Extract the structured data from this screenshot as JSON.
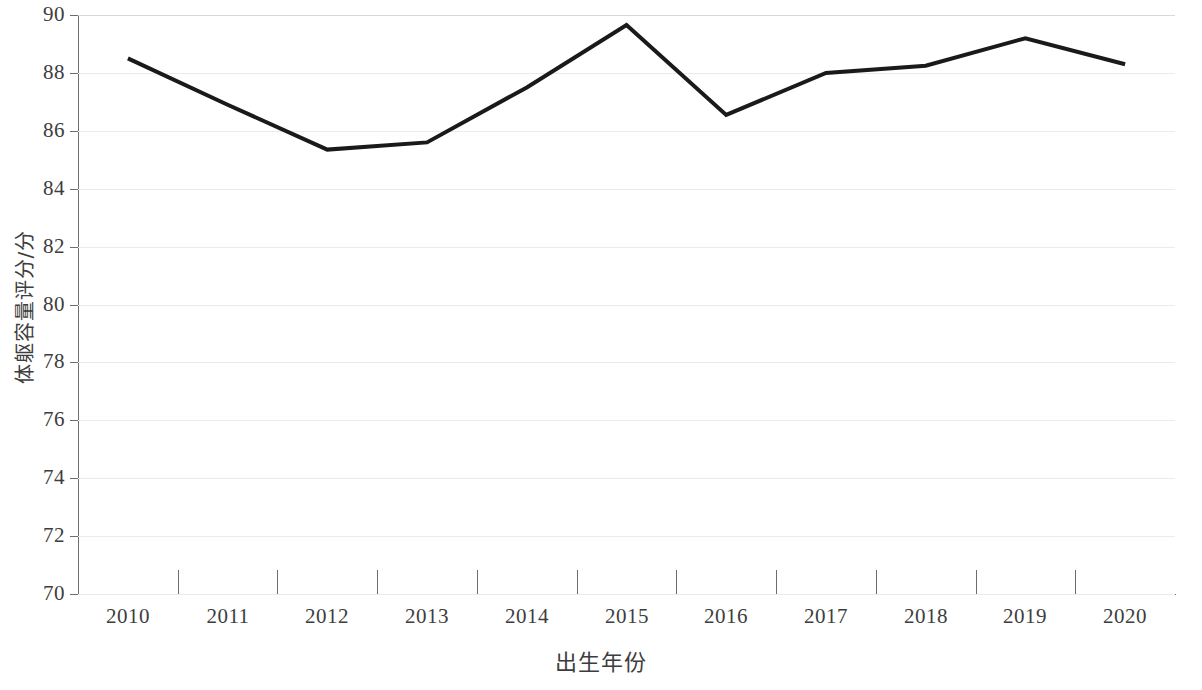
{
  "chart_data": {
    "type": "line",
    "title": "",
    "xlabel": "出生年份",
    "ylabel": "体躯容量评分/分",
    "categories": [
      "2010",
      "2011",
      "2012",
      "2013",
      "2014",
      "2015",
      "2016",
      "2017",
      "2018",
      "2019",
      "2020"
    ],
    "x": [
      2010,
      2011,
      2012,
      2013,
      2014,
      2015,
      2016,
      2017,
      2018,
      2019,
      2020
    ],
    "series": [
      {
        "name": "体躯容量评分",
        "values": [
          88.5,
          86.9,
          85.35,
          85.6,
          87.5,
          89.65,
          86.55,
          88.0,
          88.25,
          89.2,
          88.3
        ]
      }
    ],
    "ylim": [
      70,
      90
    ],
    "yticks": [
      70,
      72,
      74,
      76,
      78,
      80,
      82,
      84,
      86,
      88,
      90
    ],
    "ytick_labels": [
      "70",
      "72",
      "74",
      "76",
      "78",
      "80",
      "82",
      "84",
      "86",
      "88",
      "90"
    ],
    "grid": true,
    "grid_axis": "y",
    "legend": false,
    "line_color": "#1a1a1a",
    "line_width": 4,
    "grid_color": "#ebebeb",
    "axis_color": "#6d6d6d",
    "text_color": "#3d3d3d",
    "background_color": "#ffffff"
  }
}
